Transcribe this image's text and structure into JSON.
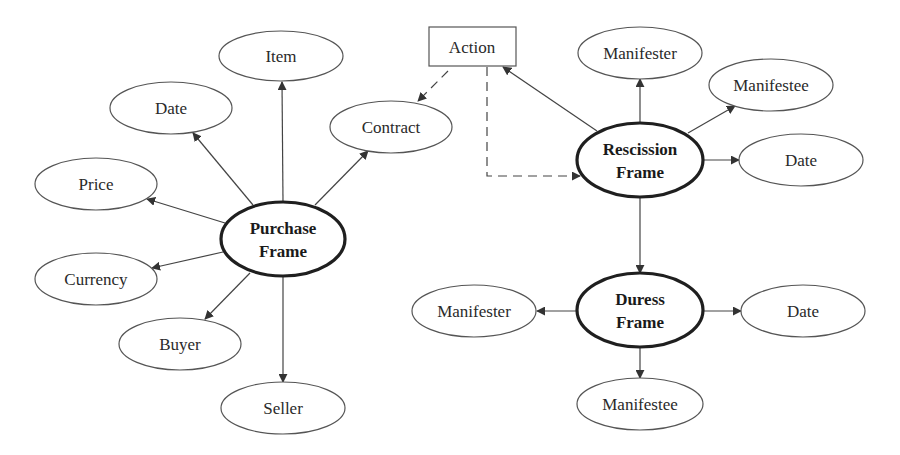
{
  "diagram": {
    "title": "",
    "purchase_frame": {
      "label_line1": "Purchase",
      "label_line2": "Frame",
      "attributes": {
        "item": "Item",
        "date": "Date",
        "price": "Price",
        "contract": "Contract",
        "currency": "Currency",
        "buyer": "Buyer",
        "seller": "Seller"
      }
    },
    "action": {
      "label": "Action"
    },
    "rescission_frame": {
      "label_line1": "Rescission",
      "label_line2": "Frame",
      "attributes": {
        "manifester": "Manifester",
        "manifestee": "Manifestee",
        "date": "Date"
      }
    },
    "duress_frame": {
      "label_line1": "Duress",
      "label_line2": "Frame",
      "attributes": {
        "manifester": "Manifester",
        "manifestee": "Manifestee",
        "date": "Date"
      }
    },
    "edges": [
      {
        "from": "Purchase Frame",
        "to": "Item",
        "style": "solid"
      },
      {
        "from": "Purchase Frame",
        "to": "Date",
        "style": "solid"
      },
      {
        "from": "Purchase Frame",
        "to": "Price",
        "style": "solid"
      },
      {
        "from": "Purchase Frame",
        "to": "Contract",
        "style": "solid"
      },
      {
        "from": "Purchase Frame",
        "to": "Currency",
        "style": "solid"
      },
      {
        "from": "Purchase Frame",
        "to": "Buyer",
        "style": "solid"
      },
      {
        "from": "Purchase Frame",
        "to": "Seller",
        "style": "solid"
      },
      {
        "from": "Action",
        "to": "Contract",
        "style": "dashed"
      },
      {
        "from": "Action",
        "to": "Rescission Frame",
        "style": "dashed"
      },
      {
        "from": "Rescission Frame",
        "to": "Action",
        "style": "solid"
      },
      {
        "from": "Rescission Frame",
        "to": "Manifester",
        "style": "solid"
      },
      {
        "from": "Rescission Frame",
        "to": "Manifestee",
        "style": "solid"
      },
      {
        "from": "Rescission Frame",
        "to": "Date",
        "style": "solid"
      },
      {
        "from": "Rescission Frame",
        "to": "Duress Frame",
        "style": "solid"
      },
      {
        "from": "Duress Frame",
        "to": "Manifester",
        "style": "solid"
      },
      {
        "from": "Duress Frame",
        "to": "Manifestee",
        "style": "solid"
      },
      {
        "from": "Duress Frame",
        "to": "Date",
        "style": "solid"
      }
    ],
    "colors": {
      "background": "#ffffff",
      "stroke": "#444444",
      "frame_stroke": "#1f1f1f",
      "text": "#2a2a2a"
    }
  }
}
